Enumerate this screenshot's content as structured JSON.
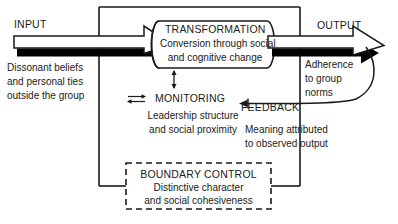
{
  "diagram": {
    "type": "systems-process-diagram",
    "colors": {
      "stroke": "#1a1a1a",
      "fill": "#ffffff",
      "text": "#1a1a1a",
      "arrow_shadow": "#000000"
    },
    "input": {
      "label": "INPUT",
      "description_lines": [
        "Dissonant beliefs",
        "and personal ties",
        "outside the group"
      ]
    },
    "output": {
      "label": "OUTPUT",
      "description_lines": [
        "Adherence",
        "to group",
        "norms"
      ]
    },
    "transformation": {
      "title": "TRANSFORMATION",
      "description_lines": [
        "Conversion through social",
        "and cognitive change"
      ]
    },
    "monitoring": {
      "title": "MONITORING",
      "description_lines": [
        "Leadership structure",
        "and social proximity"
      ]
    },
    "boundary_control": {
      "title": "BOUNDARY CONTROL",
      "description_lines": [
        "Distinctive character",
        "and social cohesiveness"
      ],
      "border_style": "dashed"
    },
    "feedback": {
      "label": "FEEDBACK",
      "description_lines": [
        "Meaning attributed",
        "to observed output"
      ]
    },
    "symbols": {
      "exchange_arrow": "equilibrium-double-arrow",
      "vertical_link_arrow": "vertical-double-arrow"
    }
  }
}
